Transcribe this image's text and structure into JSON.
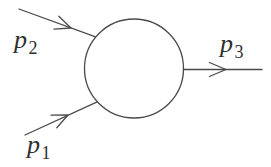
{
  "diagram": {
    "background_color": "#ffffff",
    "stroke_color": "#4a4a4a",
    "text_color": "#2f2f2f",
    "blob_shape": "circle",
    "lines": [
      {
        "id": "p2",
        "role": "incoming-top-left",
        "label": {
          "symbol": "p",
          "subscript": "2"
        }
      },
      {
        "id": "p1",
        "role": "incoming-bottom-left",
        "label": {
          "symbol": "p",
          "subscript": "1"
        }
      },
      {
        "id": "p3",
        "role": "outgoing-right",
        "label": {
          "symbol": "p",
          "subscript": "3"
        }
      }
    ]
  }
}
